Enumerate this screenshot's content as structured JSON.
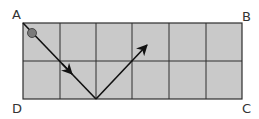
{
  "diagram": {
    "type": "reflection-path-on-grid",
    "grid": {
      "columns": 6,
      "rows": 2,
      "fill_color": "#c9c9c9",
      "line_color": "#2e2e2e",
      "x_lines": [
        23,
        60,
        96,
        132,
        169,
        206,
        242
      ],
      "y_lines": [
        23,
        61,
        99
      ]
    },
    "corners": {
      "top_left": {
        "label": "A",
        "x": 12,
        "y": 19
      },
      "top_right": {
        "label": "B",
        "x": 242,
        "y": 21
      },
      "bottom_left": {
        "label": "D",
        "x": 12,
        "y": 113
      },
      "bottom_right": {
        "label": "C",
        "x": 242,
        "y": 113
      }
    },
    "ball": {
      "cx": 32,
      "cy": 33,
      "r": 4.5,
      "color": "#7a7a7a"
    },
    "path": {
      "color": "#111111",
      "segments": [
        {
          "from": [
            23,
            23
          ],
          "to": [
            96,
            99
          ],
          "midpoint_arrow": [
            71,
            73
          ]
        },
        {
          "from": [
            96,
            99
          ],
          "to": [
            148,
            44
          ],
          "end_arrow": true
        }
      ]
    }
  }
}
